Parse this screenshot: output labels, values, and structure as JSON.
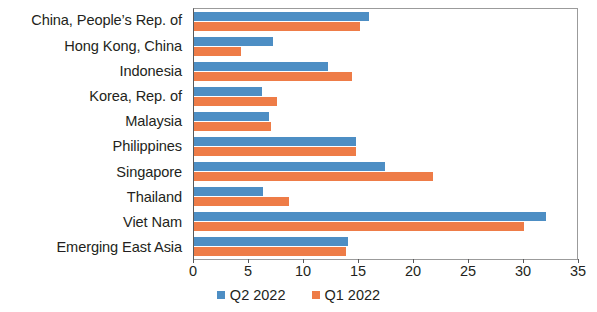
{
  "chart_data": {
    "type": "bar",
    "orientation": "horizontal",
    "title": "",
    "subtitle": "",
    "xlabel": "",
    "ylabel": "",
    "xlim": [
      0,
      35
    ],
    "xticks": [
      0,
      5,
      10,
      15,
      20,
      25,
      30,
      35
    ],
    "xtick_labels": [
      "0",
      "5",
      "10",
      "15",
      "20",
      "25",
      "30",
      "35"
    ],
    "grid": false,
    "legend_position": "bottom",
    "categories": [
      "China, People’s Rep. of",
      "Hong Kong, China",
      "Indonesia",
      "Korea, Rep. of",
      "Malaysia",
      "Philippines",
      "Singapore",
      "Thailand",
      "Viet Nam",
      "Emerging East Asia"
    ],
    "series": [
      {
        "name": "Q2 2022",
        "color": "#4d8ec4",
        "values": [
          15.9,
          7.2,
          12.2,
          6.2,
          6.8,
          14.7,
          17.4,
          6.3,
          32.0,
          14.0
        ]
      },
      {
        "name": "Q1 2022",
        "color": "#ee7c47",
        "values": [
          15.1,
          4.3,
          14.4,
          7.5,
          7.0,
          14.7,
          21.7,
          8.6,
          30.0,
          13.8
        ]
      }
    ]
  },
  "legend": {
    "items": [
      {
        "label": "Q2 2022",
        "color": "#4d8ec4"
      },
      {
        "label": "Q1 2022",
        "color": "#ee7c47"
      }
    ]
  },
  "colors": {
    "series_q2": "#4d8ec4",
    "series_q1": "#ee7c47",
    "axis": "#58595b",
    "text": "#231f20",
    "background": "#ffffff"
  }
}
